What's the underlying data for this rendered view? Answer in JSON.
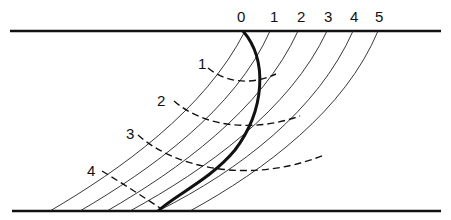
{
  "diagram": {
    "boundary_top": {
      "x1": 10,
      "y": 31,
      "x2": 441
    },
    "boundary_bottom": {
      "x1": 12,
      "y": 211,
      "x2": 441
    },
    "column_labels": [
      {
        "text": "0",
        "x": 237,
        "y": 22
      },
      {
        "text": "1",
        "x": 270,
        "y": 22
      },
      {
        "text": "2",
        "x": 297,
        "y": 22
      },
      {
        "text": "3",
        "x": 324,
        "y": 22
      },
      {
        "text": "4",
        "x": 350,
        "y": 22
      },
      {
        "text": "5",
        "x": 375,
        "y": 22
      }
    ],
    "curve_labels": [
      {
        "text": "1",
        "x": 198,
        "y": 69
      },
      {
        "text": "2",
        "x": 157,
        "y": 106
      },
      {
        "text": "3",
        "x": 126,
        "y": 139
      },
      {
        "text": "4",
        "x": 87,
        "y": 176
      }
    ],
    "thin_lines": [
      {
        "name": "line-0",
        "d": "M 245 31 C 205 110, 120 170, 50 211"
      },
      {
        "name": "line-1",
        "d": "M 270 31 C 235 110, 150 170, 80 211"
      },
      {
        "name": "line-2",
        "d": "M 298 31 C 262 110, 178 170, 107 211"
      },
      {
        "name": "line-3",
        "d": "M 327 31 C 290 110, 205 170, 130 211"
      },
      {
        "name": "line-4",
        "d": "M 353 31 C 318 110, 240 170, 158 211"
      },
      {
        "name": "line-5",
        "d": "M 378 31 C 345 110, 265 170, 190 211"
      }
    ],
    "bold_curve": {
      "d": "M 243 31 C 268 60, 265 110, 235 150 C 210 180, 175 195, 158 211"
    },
    "dashed_arcs": [
      {
        "name": "arc-1",
        "d": "M 208 68 C 225 82, 250 86, 276 74"
      },
      {
        "name": "arc-2",
        "d": "M 174 101 C 205 128, 255 132, 300 116"
      },
      {
        "name": "arc-3",
        "d": "M 138 135 C 175 168, 250 185, 324 155"
      },
      {
        "name": "arc-4",
        "d": "M 102 171 C 125 185, 145 198, 160 208"
      }
    ]
  }
}
